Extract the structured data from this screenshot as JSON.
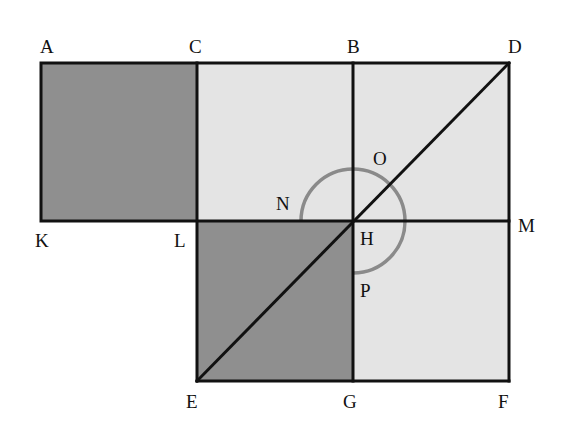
{
  "diagram": {
    "colors": {
      "dark_fill": "#8f8f8f",
      "light_fill": "#e4e4e4",
      "line": "#111111",
      "arc": "#8a8a8a"
    },
    "points": {
      "A": "A",
      "C": "C",
      "B": "B",
      "D": "D",
      "K": "K",
      "L": "L",
      "H": "H",
      "M": "M",
      "N": "N",
      "O": "O",
      "P": "P",
      "E": "E",
      "G": "G",
      "F": "F"
    }
  }
}
